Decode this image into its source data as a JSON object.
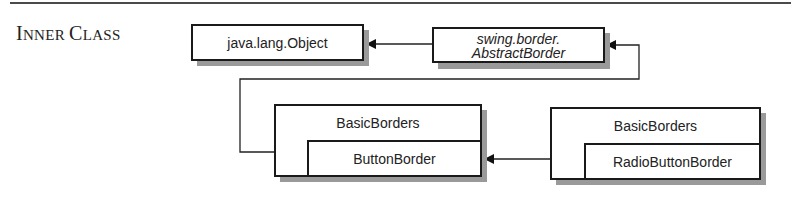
{
  "section": {
    "heading_first_big": "I",
    "heading_first_small": "NNER ",
    "heading_second_big": "C",
    "heading_second_small": "LASS",
    "heading_full": "Inner Class"
  },
  "diagram": {
    "nodes": {
      "object": {
        "label": "java.lang.Object"
      },
      "abstract_border": {
        "line1": "swing.border.",
        "line2": "AbstractBorder"
      },
      "basic_borders_left": {
        "outer": "BasicBorders",
        "inner": "ButtonBorder"
      },
      "basic_borders_right": {
        "outer": "BasicBorders",
        "inner": "RadioButtonBorder"
      }
    },
    "edges": [
      {
        "from": "swing.border.AbstractBorder",
        "to": "java.lang.Object",
        "type": "inheritance"
      },
      {
        "from": "BasicBorders.ButtonBorder",
        "to": "swing.border.AbstractBorder",
        "type": "inheritance"
      },
      {
        "from": "BasicBorders.RadioButtonBorder",
        "to": "BasicBorders.ButtonBorder",
        "type": "inheritance"
      }
    ]
  }
}
